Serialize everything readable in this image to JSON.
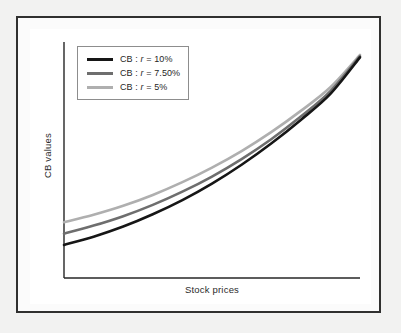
{
  "figure": {
    "frame_color": "#30302f",
    "page_background": "#f2f2f1",
    "canvas_background": "#ffffff"
  },
  "chart_data": {
    "type": "line",
    "title": "",
    "subtitle": "",
    "xlabel": "Stock prices",
    "ylabel": "CB values",
    "grid": false,
    "legend_position": "top-left",
    "axis_ticks": {
      "x": [],
      "y": []
    },
    "xlim": [
      0,
      1
    ],
    "ylim": [
      0,
      1
    ],
    "annotations": [],
    "series": [
      {
        "name": "CB : r = 10%",
        "label_prefix": "CB : ",
        "label_symbol": "r",
        "label_suffix": " = 10%",
        "color": "#161616",
        "rate_percent": 10,
        "x": [
          0.0,
          0.1,
          0.2,
          0.3,
          0.4,
          0.5,
          0.6,
          0.7,
          0.8,
          0.9,
          1.0
        ],
        "y": [
          0.14,
          0.175,
          0.218,
          0.27,
          0.33,
          0.4,
          0.48,
          0.57,
          0.67,
          0.78,
          0.935
        ]
      },
      {
        "name": "CB : r = 7.50%",
        "label_prefix": "CB : ",
        "label_symbol": "r",
        "label_suffix": " = 7.50%",
        "color": "#6e6e6e",
        "rate_percent": 7.5,
        "x": [
          0.0,
          0.1,
          0.2,
          0.3,
          0.4,
          0.5,
          0.6,
          0.7,
          0.8,
          0.9,
          1.0
        ],
        "y": [
          0.188,
          0.222,
          0.262,
          0.31,
          0.366,
          0.43,
          0.504,
          0.588,
          0.684,
          0.792,
          0.94
        ]
      },
      {
        "name": "CB : r = 5%",
        "label_prefix": "CB : ",
        "label_symbol": "r",
        "label_suffix": " = 5%",
        "color": "#afafaf",
        "rate_percent": 5,
        "x": [
          0.0,
          0.1,
          0.2,
          0.3,
          0.4,
          0.5,
          0.6,
          0.7,
          0.8,
          0.9,
          1.0
        ],
        "y": [
          0.236,
          0.268,
          0.306,
          0.352,
          0.406,
          0.468,
          0.538,
          0.618,
          0.708,
          0.808,
          0.945
        ]
      }
    ]
  }
}
